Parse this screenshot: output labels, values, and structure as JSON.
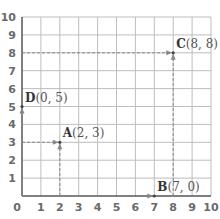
{
  "chart_data": {
    "type": "scatter",
    "title": "",
    "xlabel": "",
    "ylabel": "",
    "xlim": [
      0,
      10
    ],
    "ylim": [
      0,
      10
    ],
    "grid": true,
    "x_ticks": [
      "0",
      "1",
      "2",
      "3",
      "4",
      "5",
      "6",
      "7",
      "8",
      "9",
      "10"
    ],
    "y_ticks": [
      "1",
      "2",
      "3",
      "4",
      "5",
      "6",
      "7",
      "8",
      "9",
      "10"
    ],
    "points": [
      {
        "name": "A",
        "x": 2,
        "y": 3,
        "label": "A",
        "coord": "(2, 3)"
      },
      {
        "name": "B",
        "x": 7,
        "y": 0,
        "label": "B",
        "coord": "(7, 0)"
      },
      {
        "name": "C",
        "x": 8,
        "y": 8,
        "label": "C",
        "coord": "(8, 8)"
      },
      {
        "name": "D",
        "x": 0,
        "y": 5,
        "label": "D",
        "coord": "(0, 5)"
      }
    ],
    "annotations": [
      "dashed projection lines with arrows from axes to each point"
    ]
  },
  "colors": {
    "grid": "#bdbdbd",
    "axis": "#555555",
    "dashed": "#888888",
    "tick_text": "#6a6a6a"
  }
}
